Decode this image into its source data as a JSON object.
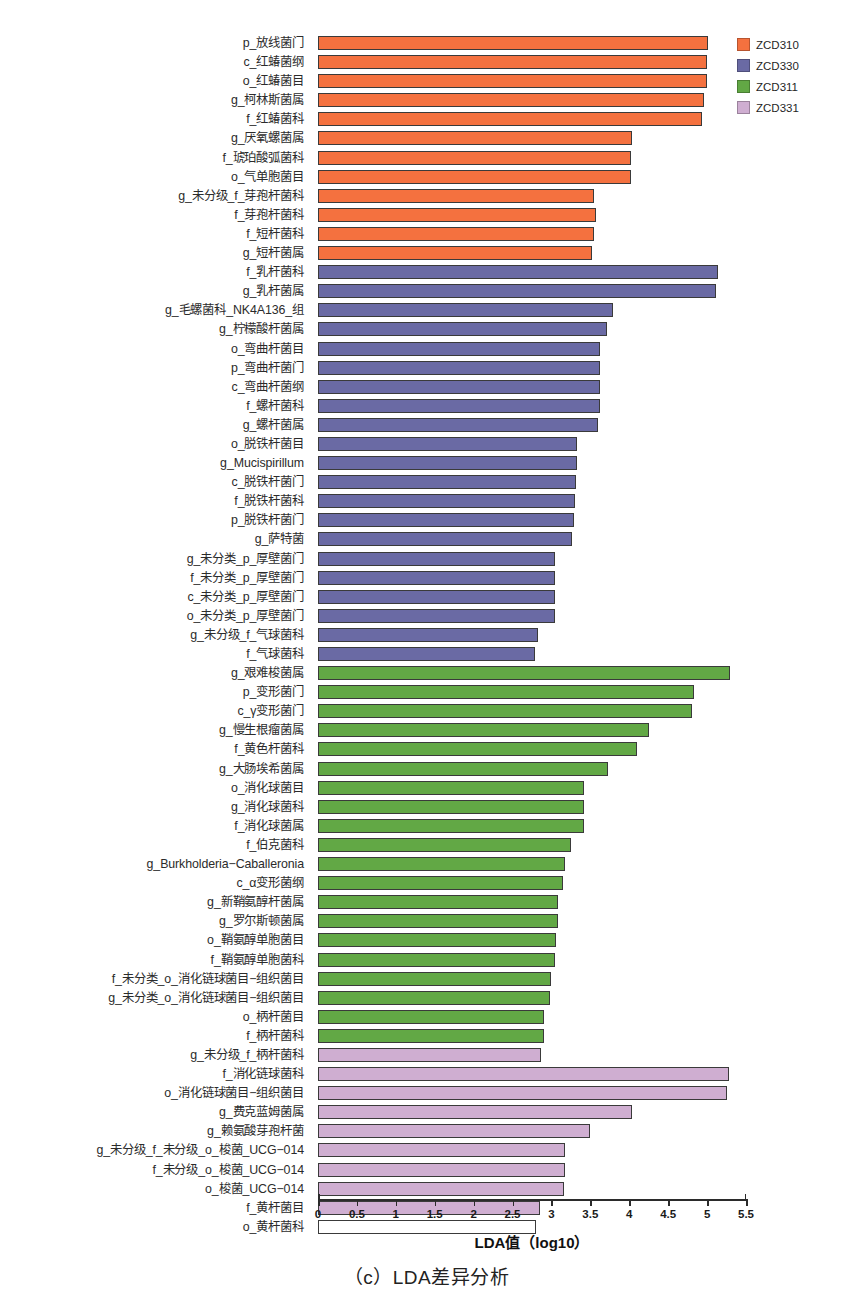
{
  "chart_data": {
    "type": "bar",
    "orientation": "horizontal",
    "title": "",
    "caption": "（c）LDA差异分析",
    "xlabel": "LDA值（log10）",
    "ylabel": "",
    "xlim": [
      0,
      5.5
    ],
    "xticks": [
      0,
      0.5,
      1,
      1.5,
      2,
      2.5,
      3,
      3.5,
      4,
      4.5,
      5,
      5.5
    ],
    "xticklabels": [
      "0",
      "0.5",
      "1",
      "1.5",
      "2",
      "2.5",
      "3",
      "3.5",
      "4",
      "4.5",
      "5",
      "5.5"
    ],
    "grid": false,
    "legend_position": "top-right",
    "legend": [
      {
        "name": "ZCD310",
        "color": "#f4713f"
      },
      {
        "name": "ZCD330",
        "color": "#6a6aa4"
      },
      {
        "name": "ZCD311",
        "color": "#62a845"
      },
      {
        "name": "ZCD331",
        "color": "#cfaed1"
      }
    ],
    "categories": [
      "p_放线菌门",
      "c_红蝽菌纲",
      "o_红蝽菌目",
      "g_柯林斯菌属",
      "f_红蝽菌科",
      "g_厌氧螺菌属",
      "f_琥珀酸弧菌科",
      "o_气单胞菌目",
      "g_未分级_f_芽孢杆菌科",
      "f_芽孢杆菌科",
      "f_短杆菌科",
      "g_短杆菌属",
      "f_乳杆菌科",
      "g_乳杆菌属",
      "g_毛螺菌科_NK4A136_组",
      "g_柠檬酸杆菌属",
      "o_弯曲杆菌目",
      "p_弯曲杆菌门",
      "c_弯曲杆菌纲",
      "f_螺杆菌科",
      "g_螺杆菌属",
      "o_脱铁杆菌目",
      "g_Mucispirillum",
      "c_脱铁杆菌门",
      "f_脱铁杆菌科",
      "p_脱铁杆菌门",
      "g_萨特菌",
      "g_未分类_p_厚壁菌门",
      "f_未分类_p_厚壁菌门",
      "c_未分类_p_厚壁菌门",
      "o_未分类_p_厚壁菌门",
      "g_未分级_f_气球菌科",
      "f_气球菌科",
      "g_艰难梭菌属",
      "p_变形菌门",
      "c_γ变形菌门",
      "g_慢生根瘤菌属",
      "f_黄色杆菌科",
      "g_大肠埃希菌属",
      "o_消化球菌目",
      "g_消化球菌科",
      "f_消化球菌属",
      "f_伯克菌科",
      "g_Burkholderia−Caballeronia",
      "c_α变形菌纲",
      "g_新鞘氨醇杆菌属",
      "g_罗尔斯顿菌属",
      "o_鞘氨醇单胞菌目",
      "f_鞘氨醇单胞菌科",
      "f_未分类_o_消化链球菌目−组织菌目",
      "g_未分类_o_消化链球菌目−组织菌目",
      "o_柄杆菌目",
      "f_柄杆菌科",
      "g_未分级_f_柄杆菌科",
      "f_消化链球菌科",
      "o_消化链球菌目−组织菌目",
      "g_费克蓝姆菌属",
      "g_赖氨酸芽孢杆菌",
      "g_未分级_f_未分级_o_梭菌_UCG−014",
      "f_未分级_o_梭菌_UCG−014",
      "o_梭菌_UCG−014",
      "f_黄杆菌目",
      "o_黄杆菌科"
    ],
    "values": [
      5.01,
      5.0,
      5.0,
      4.96,
      4.93,
      4.03,
      4.02,
      4.02,
      3.55,
      3.57,
      3.55,
      3.52,
      5.14,
      5.11,
      3.79,
      3.72,
      3.63,
      3.63,
      3.63,
      3.63,
      3.6,
      3.33,
      3.33,
      3.31,
      3.3,
      3.29,
      3.27,
      3.05,
      3.05,
      3.05,
      3.04,
      2.83,
      2.79,
      5.29,
      4.83,
      4.8,
      4.25,
      4.1,
      3.73,
      3.42,
      3.42,
      3.42,
      3.25,
      3.18,
      3.15,
      3.08,
      3.08,
      3.06,
      3.05,
      3.0,
      2.98,
      2.9,
      2.9,
      2.87,
      5.28,
      5.26,
      4.03,
      3.5,
      3.18,
      3.17,
      3.16,
      2.85,
      2.8
    ],
    "group_index": [
      0,
      0,
      0,
      0,
      0,
      0,
      0,
      0,
      0,
      0,
      0,
      0,
      1,
      1,
      1,
      1,
      1,
      1,
      1,
      1,
      1,
      1,
      1,
      1,
      1,
      1,
      1,
      1,
      1,
      1,
      1,
      1,
      1,
      2,
      2,
      2,
      2,
      2,
      2,
      2,
      2,
      2,
      2,
      2,
      2,
      2,
      2,
      2,
      2,
      2,
      2,
      2,
      2,
      3,
      3,
      3,
      3,
      3,
      3,
      3,
      3,
      3
    ]
  }
}
